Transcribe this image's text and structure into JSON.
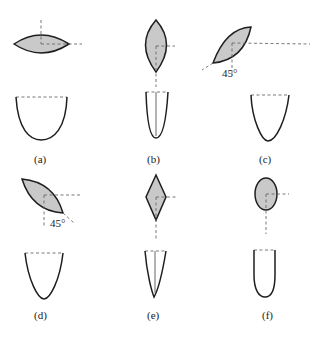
{
  "diagram": {
    "type": "cross-sections-and-profiles",
    "colors": {
      "fill": "#c9c9c9",
      "outline": "#1e1e1e",
      "dashed": "#6a6a6a",
      "background": "#ffffff"
    },
    "panels": [
      {
        "id": "a",
        "label": "(a)",
        "section": "horizontal lens (ellipse-like, pointed ends)",
        "angle": null,
        "profile": "wide U-shape"
      },
      {
        "id": "b",
        "label": "(b)",
        "section": "vertical lens (pointed ends)",
        "angle": null,
        "profile": "narrow U-shape with center line"
      },
      {
        "id": "c",
        "label": "(c)",
        "section": "lens rotated 45° (lower-left to upper-right)",
        "angle": "45°",
        "profile": "V-shaped U"
      },
      {
        "id": "d",
        "label": "(d)",
        "section": "lens rotated -45° (upper-left to lower-right)",
        "angle": "45°",
        "profile": "V-shaped U"
      },
      {
        "id": "e",
        "label": "(e)",
        "section": "vertical diamond",
        "angle": null,
        "profile": "narrow V with center line"
      },
      {
        "id": "f",
        "label": "(f)",
        "section": "vertical ellipse",
        "angle": null,
        "profile": "narrow rounded U"
      }
    ]
  }
}
